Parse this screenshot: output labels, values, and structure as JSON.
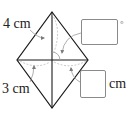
{
  "figure": {
    "shape": "rhombus",
    "colors": {
      "edge": "#1a1a1a",
      "leader": "#9a9a9a",
      "box_border": "#8a8a8a",
      "text": "#222222"
    },
    "vertices": {
      "top": [
        52,
        12
      ],
      "left": [
        17,
        60
      ],
      "right": [
        88,
        60
      ],
      "bottom": [
        52,
        108
      ]
    }
  },
  "labels": {
    "top_side": "4 cm",
    "bottom_side": "3 cm",
    "unit_after_bottom_box": "cm",
    "unit_after_top_box": "°"
  },
  "answer_boxes": [
    {
      "id": "angle-answer",
      "value": "",
      "unit": "°"
    },
    {
      "id": "length-answer",
      "value": "",
      "unit": "cm"
    }
  ]
}
